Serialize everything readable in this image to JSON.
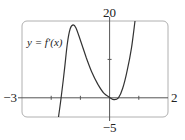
{
  "chart_data": {
    "type": "line",
    "title": "",
    "function_label": "y = f′(x)",
    "xlabel": "",
    "ylabel": "",
    "xlim": [
      -3,
      2
    ],
    "ylim": [
      -5,
      20
    ],
    "x_tick_labels": {
      "min": "−3",
      "max": "2"
    },
    "y_tick_labels": {
      "min": "−5",
      "max": "20"
    },
    "x_ticks": [
      -2,
      -1,
      0,
      1
    ],
    "y_ticks": [
      10
    ],
    "grid": false,
    "series": [
      {
        "name": "f'(x)",
        "x": [
          -1.75,
          -1.66,
          -1.55,
          -1.45,
          -1.35,
          -1.25,
          -1.15,
          -1.0,
          -0.8,
          -0.6,
          -0.4,
          -0.2,
          0.0,
          0.15,
          0.3,
          0.45,
          0.6,
          0.75,
          0.87
        ],
        "y": [
          -5,
          0,
          7,
          14,
          18,
          19,
          18.2,
          15,
          10.5,
          6.5,
          3.5,
          1.2,
          0.1,
          -0.5,
          0.0,
          2.5,
          7,
          13,
          20
        ]
      }
    ],
    "colors": {
      "curve": "#333333",
      "axis": "#555555",
      "frame": "#aaaaaa"
    }
  }
}
